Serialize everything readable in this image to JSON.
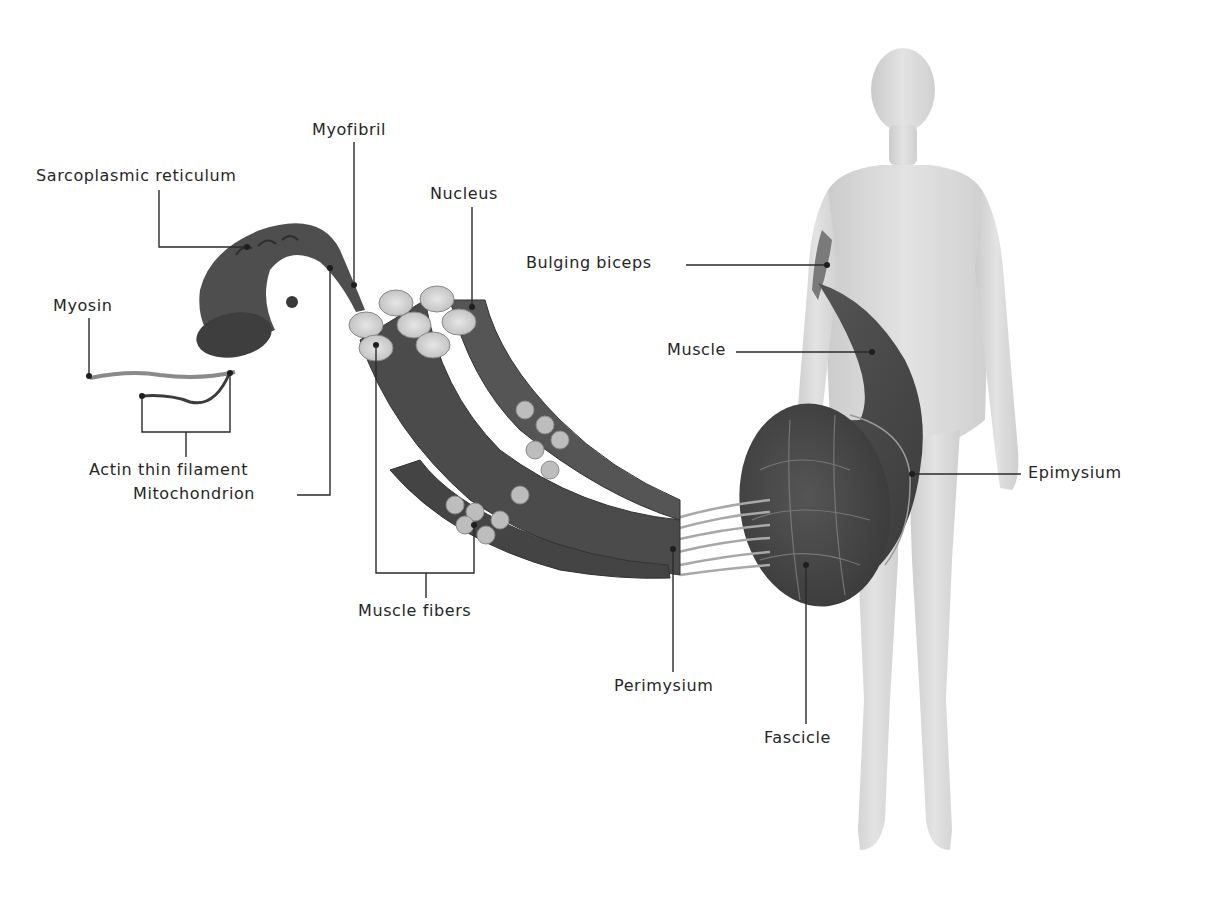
{
  "diagram": {
    "labels": {
      "myofibril": "Myofibril",
      "sarcoplasmic_reticulum": "Sarcoplasmic reticulum",
      "nucleus": "Nucleus",
      "bulging_biceps": "Bulging biceps",
      "myosin": "Myosin",
      "muscle": "Muscle",
      "actin_thin_filament": "Actin thin filament",
      "epimysium": "Epimysium",
      "mitochondrion": "Mitochondrion",
      "muscle_fibers": "Muscle fibers",
      "perimysium": "Perimysium",
      "fascicle": "Fascicle"
    },
    "colors": {
      "background": "#ffffff",
      "label_text": "#262626",
      "leader_line": "#2a2a2a",
      "muscle_tissue": "#4a4a4a",
      "fiber_end": "#cfcfcf",
      "body_silhouette": "#d2d2d2"
    }
  }
}
